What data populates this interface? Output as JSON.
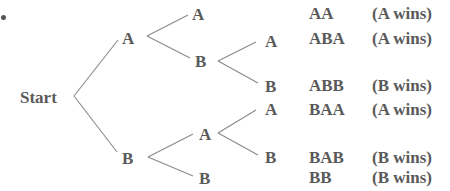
{
  "diagram": {
    "type": "probability-tree",
    "root": "Start",
    "nodes": {
      "l1_A": "A",
      "l1_B": "B",
      "l2_AA": "A",
      "l2_AB": "B",
      "l2_BA": "A",
      "l2_BB": "B",
      "l3_ABA": "A",
      "l3_ABB": "B",
      "l3_BAA": "A",
      "l3_BAB": "B"
    },
    "outcomes": [
      {
        "sequence": "AA",
        "result": "(A wins)"
      },
      {
        "sequence": "ABA",
        "result": "(A wins)"
      },
      {
        "sequence": "ABB",
        "result": "(B wins)"
      },
      {
        "sequence": "BAA",
        "result": "(A wins)"
      },
      {
        "sequence": "BAB",
        "result": "(B wins)"
      },
      {
        "sequence": "BB",
        "result": "(B wins)"
      }
    ],
    "line_color": "#8a8a8a",
    "text_color": "#5a5a5a"
  }
}
